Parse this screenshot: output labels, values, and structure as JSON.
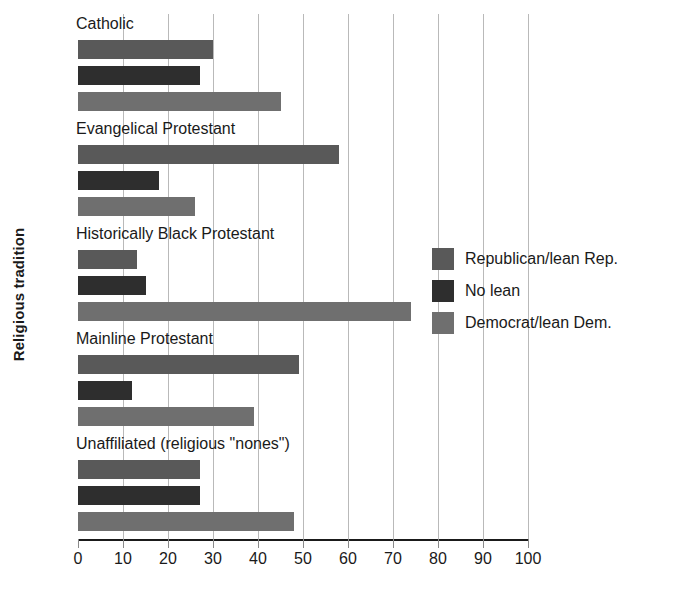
{
  "chart_data": {
    "type": "bar",
    "orientation": "horizontal",
    "title": "",
    "xlabel": "",
    "ylabel": "Religious tradition",
    "xlim": [
      0,
      100
    ],
    "xticks": [
      0,
      10,
      20,
      30,
      40,
      50,
      60,
      70,
      80,
      90,
      100
    ],
    "grid": true,
    "legend_position": "center-right",
    "categories": [
      "Catholic",
      "Evangelical Protestant",
      "Historically Black Protestant",
      "Mainline Protestant",
      "Unaffiliated (religious \"nones\")"
    ],
    "series": [
      {
        "name": "Republican/lean Rep.",
        "color": "#595959",
        "values": [
          30,
          58,
          13,
          49,
          27
        ]
      },
      {
        "name": "No lean",
        "color": "#2e2e2e",
        "values": [
          27,
          18,
          15,
          12,
          27
        ]
      },
      {
        "name": "Democrat/lean Dem.",
        "color": "#6f6f6f",
        "values": [
          45,
          26,
          74,
          39,
          48
        ]
      }
    ]
  },
  "axis": {
    "y_title": "Religious tradition",
    "x_tick_labels": [
      "0",
      "10",
      "20",
      "30",
      "40",
      "50",
      "60",
      "70",
      "80",
      "90",
      "100"
    ]
  },
  "legend": {
    "items": [
      {
        "label": "Republican/lean Rep.",
        "color": "#595959"
      },
      {
        "label": "No lean",
        "color": "#2e2e2e"
      },
      {
        "label": "Democrat/lean Dem.",
        "color": "#6f6f6f"
      }
    ]
  }
}
